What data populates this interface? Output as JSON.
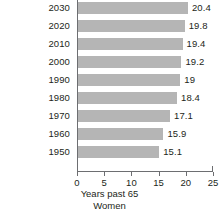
{
  "chart_data": {
    "type": "bar",
    "orientation": "horizontal",
    "title": "",
    "xlabel": "Years past 65",
    "ylabel": "",
    "series_caption": "Women",
    "categories": [
      "2030",
      "2020",
      "2010",
      "2000",
      "1990",
      "1980",
      "1970",
      "1960",
      "1950"
    ],
    "values": [
      20.4,
      19.8,
      19.4,
      19.2,
      19,
      18.4,
      17.1,
      15.9,
      15.1
    ],
    "value_labels": [
      "20.4",
      "19.8",
      "19.4",
      "19.2",
      "19",
      "18.4",
      "17.1",
      "15.9",
      "15.1"
    ],
    "xlim": [
      0,
      25
    ],
    "xticks": [
      0,
      5,
      10,
      15,
      20,
      25
    ],
    "xtick_labels": [
      "0",
      "5",
      "10",
      "15",
      "20",
      "25"
    ],
    "grid": false,
    "legend": false,
    "bar_color": "#b5b5b5",
    "axis_color": "#6d6e71",
    "text_color": "#231f20",
    "background": "#ffffff"
  }
}
